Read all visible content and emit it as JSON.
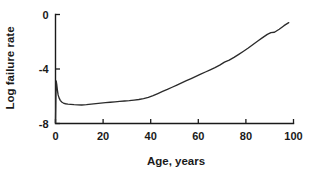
{
  "chart_data": {
    "type": "line",
    "title": "",
    "xlabel": "Age, years",
    "ylabel": "Log failure rate",
    "xlim": [
      0,
      100
    ],
    "ylim": [
      -8,
      0
    ],
    "xticks": [
      0,
      20,
      40,
      60,
      80,
      100
    ],
    "yticks": [
      0,
      -4,
      -8
    ],
    "xtick_labels": [
      "0",
      "20",
      "40",
      "60",
      "80",
      "100"
    ],
    "ytick_labels": [
      "0",
      "-4",
      "-8"
    ],
    "grid": false,
    "legend": false,
    "series": [
      {
        "name": "Log failure rate",
        "x": [
          0.0,
          0.15,
          0.3,
          0.5,
          0.8,
          1.1,
          1.5,
          2.0,
          2.6,
          3.3,
          4.2,
          5.2,
          6.4,
          7.8,
          9.3,
          11.0,
          13.0,
          15.0,
          17.0,
          19.0,
          21.0,
          23.0,
          25.0,
          27.0,
          29.0,
          31.0,
          33.0,
          35.0,
          37.0,
          39.0,
          41.0,
          43.0,
          45.0,
          47.0,
          49.0,
          51.0,
          53.0,
          55.0,
          57.0,
          59.0,
          61.0,
          63.0,
          65.0,
          67.0,
          69.0,
          71.0,
          73.0,
          75.0,
          77.0,
          79.0,
          81.0,
          83.0,
          85.0,
          87.0,
          89.0,
          90.5,
          92.0,
          94.0,
          96.0,
          98.0
        ],
        "y": [
          -7.95,
          -6.2,
          -4.88,
          -5.1,
          -5.55,
          -5.9,
          -6.12,
          -6.3,
          -6.42,
          -6.5,
          -6.55,
          -6.58,
          -6.6,
          -6.62,
          -6.63,
          -6.64,
          -6.62,
          -6.58,
          -6.54,
          -6.5,
          -6.47,
          -6.44,
          -6.41,
          -6.38,
          -6.35,
          -6.32,
          -6.28,
          -6.24,
          -6.18,
          -6.08,
          -5.95,
          -5.8,
          -5.65,
          -5.5,
          -5.34,
          -5.18,
          -5.02,
          -4.86,
          -4.7,
          -4.54,
          -4.38,
          -4.22,
          -4.06,
          -3.9,
          -3.72,
          -3.5,
          -3.35,
          -3.15,
          -2.93,
          -2.7,
          -2.46,
          -2.2,
          -1.95,
          -1.7,
          -1.46,
          -1.33,
          -1.3,
          -1.08,
          -0.82,
          -0.6
        ]
      }
    ],
    "annotations": []
  }
}
